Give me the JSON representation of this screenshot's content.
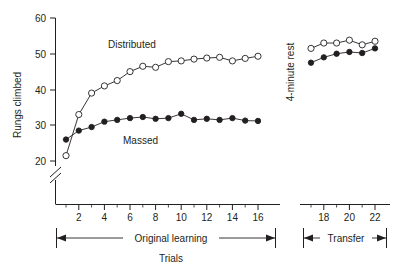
{
  "chart_data": {
    "type": "line",
    "title": "",
    "xlabel": "Trials",
    "ylabel": "Rungs climbed",
    "ylim": [
      20,
      60
    ],
    "yticks": [
      20,
      30,
      40,
      50,
      60
    ],
    "grid": false,
    "axis_break_y": true,
    "axis_break_x": true,
    "legend_position": "inline-annotation",
    "annotations": [
      {
        "text": "Distributed",
        "note": "label for open-circle series"
      },
      {
        "text": "Massed",
        "note": "label for filled-circle series"
      },
      {
        "text": "4-minute rest",
        "note": "vertical label at axis break between phases"
      }
    ],
    "phases": [
      {
        "label": "Original learning",
        "trials": [
          1,
          2,
          3,
          4,
          5,
          6,
          7,
          8,
          9,
          10,
          11,
          12,
          13,
          14,
          15,
          16
        ]
      },
      {
        "label": "Transfer",
        "trials": [
          17,
          18,
          19,
          20,
          21,
          22
        ]
      }
    ],
    "xticks_labeled": [
      2,
      4,
      6,
      8,
      10,
      12,
      14,
      16,
      18,
      20,
      22
    ],
    "x": [
      1,
      2,
      3,
      4,
      5,
      6,
      7,
      8,
      9,
      10,
      11,
      12,
      13,
      14,
      15,
      16,
      17,
      18,
      19,
      20,
      21,
      22
    ],
    "series": [
      {
        "name": "Distributed",
        "marker": "open-circle",
        "values": [
          21.5,
          33.0,
          39.0,
          41.0,
          42.5,
          45.0,
          46.5,
          46.2,
          47.8,
          48.0,
          48.5,
          48.8,
          49.0,
          48.0,
          48.7,
          49.3,
          51.5,
          53.0,
          53.0,
          53.8,
          52.5,
          53.5
        ]
      },
      {
        "name": "Massed",
        "marker": "filled-circle",
        "values": [
          26.0,
          28.5,
          29.5,
          31.0,
          31.5,
          32.0,
          32.3,
          31.8,
          32.0,
          33.2,
          31.5,
          31.8,
          31.5,
          32.0,
          31.3,
          31.2,
          47.5,
          49.0,
          50.0,
          50.5,
          50.2,
          51.5
        ]
      }
    ]
  },
  "labels": {
    "y_axis_title": "Rungs climbed",
    "x_axis_title": "Trials",
    "series_distributed": "Distributed",
    "series_massed": "Massed",
    "rest_note": "4-minute rest",
    "phase_original": "Original learning",
    "phase_transfer": "Transfer"
  },
  "ytick_labels": [
    "60",
    "50",
    "40",
    "30",
    "20"
  ],
  "xtick_labels_left": [
    "2",
    "4",
    "6",
    "8",
    "10",
    "12",
    "14",
    "16"
  ],
  "xtick_labels_right": [
    "18",
    "20",
    "22"
  ],
  "colors": {
    "ink": "#231f20",
    "background": "#ffffff",
    "open_marker_fill": "#ffffff"
  }
}
